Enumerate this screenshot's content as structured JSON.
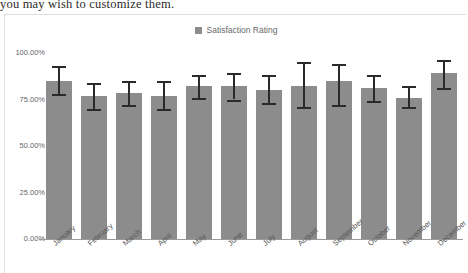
{
  "document": {
    "trailing_text": "you may wish to customize them."
  },
  "chart_card": {
    "legend": {
      "swatch_color": "#8c8c8c",
      "label": "Satisfaction Rating"
    }
  },
  "chart_data": {
    "type": "bar",
    "title": "",
    "subtitle": "",
    "xlabel": "",
    "ylabel": "",
    "grid": false,
    "legend_position": "top-center",
    "legend_entries": [
      "Satisfaction Rating"
    ],
    "series_color": "#8c8c8c",
    "error_bar_color": "#2a2a2a",
    "ylim": [
      0,
      100
    ],
    "ytick_labels": [
      "100.00%",
      "75.00%",
      "50.00%",
      "25.00%",
      "0.00%"
    ],
    "ytick_values": [
      100,
      75,
      50,
      25,
      0
    ],
    "categories": [
      "January",
      "February",
      "March",
      "April",
      "May",
      "June",
      "July",
      "August",
      "September",
      "October",
      "November",
      "December"
    ],
    "series": [
      {
        "name": "Satisfaction Rating",
        "values": [
          85,
          77,
          78.5,
          77,
          82,
          82,
          80,
          82,
          85,
          81,
          76,
          89
        ],
        "errors_low": [
          78,
          70,
          72,
          70,
          76,
          75,
          73,
          71,
          72,
          74,
          71,
          81
        ],
        "errors_high": [
          93,
          84,
          85,
          85,
          88,
          89,
          88,
          95,
          94,
          88,
          82,
          96
        ]
      }
    ]
  }
}
